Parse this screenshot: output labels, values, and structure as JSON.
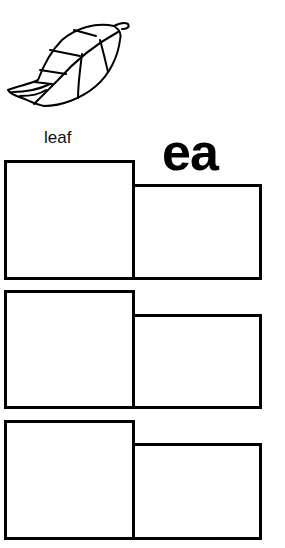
{
  "worksheet": {
    "picture": "leaf-icon",
    "word": "leaf",
    "vowel_team": "ea",
    "rows": [
      {
        "left_box": "",
        "right_box": ""
      },
      {
        "left_box": "",
        "right_box": ""
      },
      {
        "left_box": "",
        "right_box": ""
      }
    ],
    "footer": "· · · · · · · · ·"
  },
  "colors": {
    "ink": "#000000",
    "background": "#ffffff"
  }
}
